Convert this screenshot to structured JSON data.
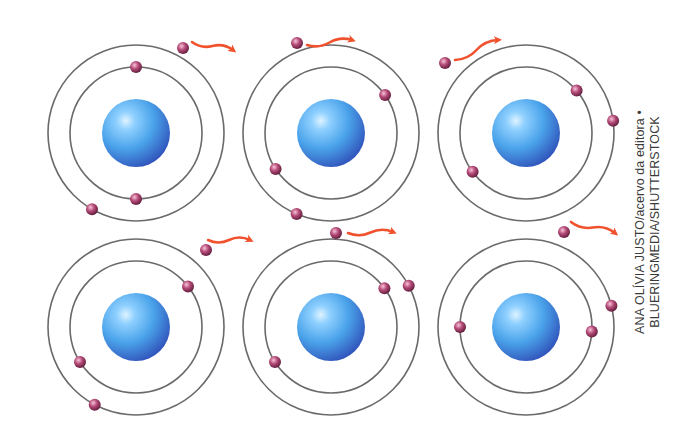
{
  "figure": {
    "colors": {
      "background": "#ffffff",
      "orbit": "#6a6a6a",
      "nucleus_light": "#bfe6ff",
      "nucleus_mid": "#4aa3ea",
      "nucleus_dark": "#2f4fb8",
      "electron_light": "#f4b4cc",
      "electron_mid": "#b54a78",
      "electron_dark": "#5a1a38",
      "arrow": "#f0522e"
    },
    "atoms": [
      {
        "id": "atom-1",
        "cx": 136,
        "cy": 133,
        "electrons": [
          {
            "orbit": "inner",
            "angle": -90
          },
          {
            "orbit": "inner",
            "angle": 90
          },
          {
            "orbit": "outer",
            "angle": 120
          }
        ],
        "free_electron": {
          "x": 183,
          "y": 48
        },
        "arrow": {
          "x1": 192,
          "y1": 42,
          "x2": 233,
          "y2": 50
        }
      },
      {
        "id": "atom-2",
        "cx": 331,
        "cy": 133,
        "electrons": [
          {
            "orbit": "inner",
            "angle": -35
          },
          {
            "orbit": "inner",
            "angle": 147
          },
          {
            "orbit": "outer",
            "angle": 113
          }
        ],
        "free_electron": {
          "x": 297,
          "y": 43
        },
        "arrow": {
          "x1": 307,
          "y1": 45,
          "x2": 352,
          "y2": 40
        }
      },
      {
        "id": "atom-3",
        "cx": 526,
        "cy": 133,
        "electrons": [
          {
            "orbit": "inner",
            "angle": -40
          },
          {
            "orbit": "inner",
            "angle": 144
          },
          {
            "orbit": "outer",
            "angle": -8
          }
        ],
        "free_electron": {
          "x": 445,
          "y": 63
        },
        "arrow": {
          "x1": 455,
          "y1": 60,
          "x2": 498,
          "y2": 40
        }
      },
      {
        "id": "atom-4",
        "cx": 136,
        "cy": 327,
        "electrons": [
          {
            "orbit": "inner",
            "angle": -38
          },
          {
            "orbit": "inner",
            "angle": 148
          },
          {
            "orbit": "outer",
            "angle": 118
          }
        ],
        "free_electron": {
          "x": 206,
          "y": 250
        },
        "arrow": {
          "x1": 208,
          "y1": 240,
          "x2": 250,
          "y2": 240
        }
      },
      {
        "id": "atom-5",
        "cx": 331,
        "cy": 327,
        "electrons": [
          {
            "orbit": "inner",
            "angle": -36
          },
          {
            "orbit": "inner",
            "angle": 148
          },
          {
            "orbit": "outer",
            "angle": -28
          }
        ],
        "free_electron": {
          "x": 336,
          "y": 233
        },
        "arrow": {
          "x1": 348,
          "y1": 233,
          "x2": 393,
          "y2": 232
        }
      },
      {
        "id": "atom-6",
        "cx": 526,
        "cy": 327,
        "electrons": [
          {
            "orbit": "inner",
            "angle": 180
          },
          {
            "orbit": "inner",
            "angle": 4
          },
          {
            "orbit": "outer",
            "angle": -14
          }
        ],
        "free_electron": {
          "x": 564,
          "y": 232
        },
        "arrow": {
          "x1": 571,
          "y1": 222,
          "x2": 615,
          "y2": 233
        }
      }
    ],
    "geometry": {
      "outer_radius": 88,
      "inner_radius": 66,
      "nucleus_radius": 34,
      "electron_radius": 6
    }
  },
  "credit": {
    "line1": "ANA OLÍVIA JUSTO/acervo da editora •",
    "line2": "BLUERINGMEDIA/SHUTTERSTOCK"
  }
}
